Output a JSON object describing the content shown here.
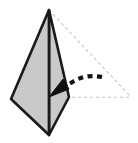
{
  "figure": {
    "title": "Pyramid fold step diagram",
    "canvas": {
      "width": 138,
      "height": 143,
      "background": "#ffffff"
    },
    "colors": {
      "face_fill": "#c9c9c9",
      "outline": "#1a1a1a",
      "ghost_line": "#c4c4c4",
      "arrow": "#111111",
      "background": "#ffffff"
    },
    "solid_shape": {
      "name": "paper-pyramid-body",
      "description": "Solid shaded pyramid seen from the front, folded flat",
      "apex": [
        49,
        10
      ],
      "left_vertex": [
        11,
        99
      ],
      "bottom_vertex": [
        49,
        135
      ],
      "right_vertex": [
        69,
        97
      ],
      "outline_width": 2.6,
      "left_face_points": "49,10 11,99 49,135",
      "right_face_points": "49,10 69,97 49,135",
      "center_edge": {
        "from": [
          49,
          10
        ],
        "to": [
          49,
          135
        ],
        "width": 2.2
      }
    },
    "ghost_shape": {
      "name": "ghost-flap-outline",
      "description": "Dashed light-gray outline of the unfolded flap on the right",
      "apex": [
        49,
        10
      ],
      "far_vertex": [
        131,
        97
      ],
      "near_vertex": [
        69,
        97
      ],
      "dash_pattern": "3 3",
      "stroke_width": 1.1
    },
    "arrow": {
      "name": "fold-direction-arrow",
      "description": "Dashed arrow curving down-left indicating the fold direction",
      "tail": [
        102,
        77
      ],
      "tip": [
        49,
        97
      ],
      "dash_pattern": "5 4.5",
      "stroke_width": 4.2,
      "head_length": 16,
      "head_width": 13,
      "head_points": "49,97 69,89 63,79"
    }
  }
}
